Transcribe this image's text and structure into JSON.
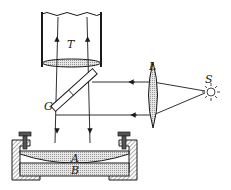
{
  "figure": {
    "labels": {
      "tube": "T",
      "glass_plate": "G",
      "lens": "L",
      "source": "S",
      "upper_lens": "A",
      "lower_plate": "B"
    },
    "colors": {
      "ink": "#1a1a1a",
      "glass_fill": "#c9c9c9",
      "background": "#ffffff"
    }
  }
}
